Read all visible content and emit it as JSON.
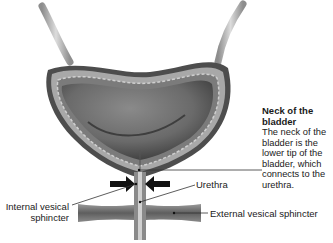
{
  "diagram": {
    "labels": {
      "neck_title": "Neck of the bladder",
      "neck_desc": "The neck of the bladder is the lower tip of the bladder, which connects to the urethra.",
      "urethra": "Urethra",
      "internal_sphincter": "Internal vesical sphincter",
      "external_sphincter": "External vesical sphincter"
    },
    "colors": {
      "wall_outer": "#4a4a4a",
      "wall_layer": "#9a9a9a",
      "lumen": "#6e6e6e",
      "ureter": "#bdbdbd",
      "muscle": "#7a7a7a",
      "arrow": "#111111",
      "leader": "#333333"
    }
  }
}
